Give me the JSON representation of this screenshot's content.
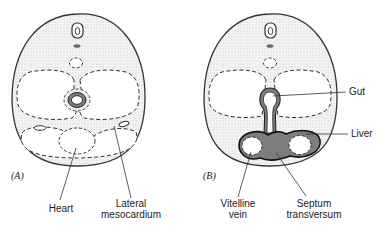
{
  "panels": [
    {
      "id": "A",
      "label": "(A)",
      "annotations": [
        {
          "text": "Heart"
        },
        {
          "text_line1": "Lateral",
          "text_line2": "mesocardium"
        }
      ]
    },
    {
      "id": "B",
      "label": "(B)",
      "annotations": [
        {
          "text": "Gut"
        },
        {
          "text": "Liver"
        },
        {
          "text_line1": "Vitelline",
          "text_line2": "vein"
        },
        {
          "text_line1": "Septum",
          "text_line2": "transversum"
        }
      ]
    }
  ],
  "colors": {
    "outline": "#333333",
    "stipple": "#d9d9d9",
    "background": "#ffffff"
  }
}
